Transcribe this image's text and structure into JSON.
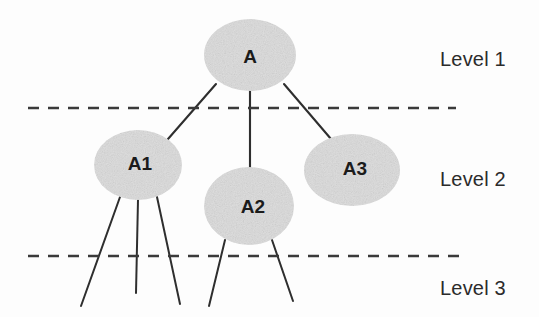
{
  "diagram": {
    "type": "tree-hierarchy",
    "background_color": "#fdfdfd",
    "node_fill_color": "#dedede",
    "node_text_color": "#1b1b1b",
    "edge_color": "#2f2f2f",
    "divider_color": "#3a3a3a",
    "nodes": [
      {
        "id": "A",
        "label": "A",
        "level": 1,
        "cx": 250,
        "cy": 55,
        "rx": 46,
        "ry": 36
      },
      {
        "id": "A1",
        "label": "A1",
        "level": 2,
        "cx": 138,
        "cy": 165,
        "rx": 44,
        "ry": 35
      },
      {
        "id": "A2",
        "label": "A2",
        "level": 2,
        "cx": 249,
        "cy": 206,
        "rx": 45,
        "ry": 39
      },
      {
        "id": "A3",
        "label": "A3",
        "level": 2,
        "cx": 352,
        "cy": 170,
        "rx": 48,
        "ry": 36
      }
    ],
    "edges": [
      {
        "from": "A",
        "to": "A1",
        "x1": 216,
        "y1": 84,
        "x2": 168,
        "y2": 139
      },
      {
        "from": "A",
        "to": "A2",
        "x1": 250,
        "y1": 90,
        "x2": 250,
        "y2": 169
      },
      {
        "from": "A",
        "to": "A3",
        "x1": 284,
        "y1": 84,
        "x2": 331,
        "y2": 139
      },
      {
        "from": "A1",
        "to": "leaf-1",
        "x1": 120,
        "y1": 197,
        "x2": 81,
        "y2": 306
      },
      {
        "from": "A1",
        "to": "leaf-2",
        "x1": 138,
        "y1": 200,
        "x2": 136,
        "y2": 293
      },
      {
        "from": "A1",
        "to": "leaf-3",
        "x1": 157,
        "y1": 197,
        "x2": 180,
        "y2": 304
      },
      {
        "from": "A2",
        "to": "leaf-4",
        "x1": 225,
        "y1": 240,
        "x2": 209,
        "y2": 306
      },
      {
        "from": "A2",
        "to": "leaf-5",
        "x1": 272,
        "y1": 240,
        "x2": 293,
        "y2": 301
      }
    ],
    "dividers": [
      {
        "id": "divider-level-1-2",
        "y": 108,
        "x1": 28,
        "x2": 456
      },
      {
        "id": "divider-level-2-3",
        "y": 256,
        "x1": 28,
        "x2": 466
      }
    ],
    "level_labels": [
      {
        "id": "level-1",
        "text": "Level 1",
        "x": 440,
        "y": 48
      },
      {
        "id": "level-2",
        "text": "Level 2",
        "x": 440,
        "y": 168
      },
      {
        "id": "level-3",
        "text": "Level 3",
        "x": 440,
        "y": 277
      }
    ]
  }
}
